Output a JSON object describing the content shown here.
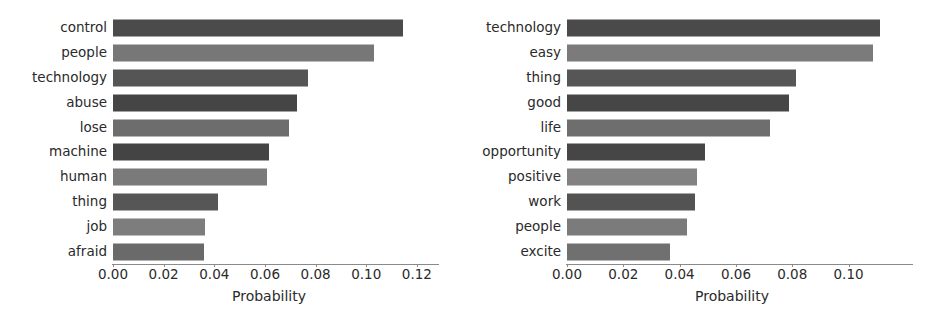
{
  "chart_data": [
    {
      "type": "bar",
      "orientation": "horizontal",
      "title": "",
      "xlabel": "Probability",
      "ylabel": "",
      "xlim": [
        0.0,
        0.1232
      ],
      "grid": false,
      "legend": null,
      "xticks": [
        0.0,
        0.02,
        0.04,
        0.06,
        0.08,
        0.1,
        0.12
      ],
      "xticklabels": [
        "0.00",
        "0.02",
        "0.04",
        "0.06",
        "0.08",
        "0.10",
        "0.12"
      ],
      "categories": [
        "control",
        "people",
        "technology",
        "abuse",
        "lose",
        "machine",
        "human",
        "thing",
        "job",
        "afraid"
      ],
      "values": [
        0.1145,
        0.103,
        0.077,
        0.0725,
        0.0695,
        0.0615,
        0.061,
        0.0415,
        0.0365,
        0.036
      ],
      "bar_colors": [
        "#4b4b4b",
        "#777777",
        "#555555",
        "#454545",
        "#6d6d6d",
        "#444444",
        "#7a7a7a",
        "#565656",
        "#7d7d7d",
        "#6a6a6a"
      ]
    },
    {
      "type": "bar",
      "orientation": "horizontal",
      "title": "",
      "xlabel": "Probability",
      "ylabel": "",
      "xlim": [
        0.0,
        0.1172
      ],
      "grid": false,
      "legend": null,
      "xticks": [
        0.0,
        0.02,
        0.04,
        0.06,
        0.08,
        0.1
      ],
      "xticklabels": [
        "0.00",
        "0.02",
        "0.04",
        "0.06",
        "0.08",
        "0.10"
      ],
      "categories": [
        "technology",
        "easy",
        "thing",
        "good",
        "life",
        "opportunity",
        "positive",
        "work",
        "people",
        "excite"
      ],
      "values": [
        0.111,
        0.1085,
        0.0815,
        0.079,
        0.072,
        0.049,
        0.046,
        0.0455,
        0.0425,
        0.0365
      ],
      "bar_colors": [
        "#4a4a4a",
        "#7b7b7b",
        "#565656",
        "#464646",
        "#6e6e6e",
        "#464646",
        "#828282",
        "#535353",
        "#7b7b7b",
        "#707070"
      ]
    }
  ],
  "panels": {
    "left": {
      "xaxis_title": "Probability",
      "ticks": [
        "0.00",
        "0.02",
        "0.04",
        "0.06",
        "0.08",
        "0.10",
        "0.12"
      ],
      "rows": [
        {
          "label": "control",
          "value": 0.1145
        },
        {
          "label": "people",
          "value": 0.103
        },
        {
          "label": "technology",
          "value": 0.077
        },
        {
          "label": "abuse",
          "value": 0.0725
        },
        {
          "label": "lose",
          "value": 0.0695
        },
        {
          "label": "machine",
          "value": 0.0615
        },
        {
          "label": "human",
          "value": 0.061
        },
        {
          "label": "thing",
          "value": 0.0415
        },
        {
          "label": "job",
          "value": 0.0365
        },
        {
          "label": "afraid",
          "value": 0.036
        }
      ]
    },
    "right": {
      "xaxis_title": "Probability",
      "ticks": [
        "0.00",
        "0.02",
        "0.04",
        "0.06",
        "0.08",
        "0.10"
      ],
      "rows": [
        {
          "label": "technology",
          "value": 0.111
        },
        {
          "label": "easy",
          "value": 0.1085
        },
        {
          "label": "thing",
          "value": 0.0815
        },
        {
          "label": "good",
          "value": 0.079
        },
        {
          "label": "life",
          "value": 0.072
        },
        {
          "label": "opportunity",
          "value": 0.049
        },
        {
          "label": "positive",
          "value": 0.046
        },
        {
          "label": "work",
          "value": 0.0455
        },
        {
          "label": "people",
          "value": 0.0425
        },
        {
          "label": "excite",
          "value": 0.0365
        }
      ]
    }
  }
}
